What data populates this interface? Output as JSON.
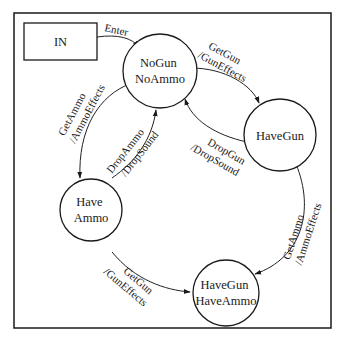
{
  "diagram": {
    "type": "state-diagram",
    "initial": {
      "id": "IN",
      "label": "IN"
    },
    "states": [
      {
        "id": "nogun_noammo",
        "lines": [
          "NoGun",
          "NoAmmo"
        ]
      },
      {
        "id": "havegun",
        "lines": [
          "HaveGun"
        ]
      },
      {
        "id": "haveammo",
        "lines": [
          "Have",
          "Ammo"
        ]
      },
      {
        "id": "havegun_haveammo",
        "lines": [
          "HaveGun",
          "HaveAmmo"
        ]
      }
    ],
    "transitions": [
      {
        "from": "IN",
        "to": "nogun_noammo",
        "lines": [
          "Enter"
        ]
      },
      {
        "from": "nogun_noammo",
        "to": "havegun",
        "lines": [
          "GetGun",
          "/GunEffects"
        ]
      },
      {
        "from": "havegun",
        "to": "nogun_noammo",
        "lines": [
          "DropGun",
          "/DropSound"
        ]
      },
      {
        "from": "nogun_noammo",
        "to": "haveammo",
        "lines": [
          "GetAmmo",
          "/AmmoEffects"
        ]
      },
      {
        "from": "haveammo",
        "to": "nogun_noammo",
        "lines": [
          "DropAmmo",
          "/DropSound"
        ]
      },
      {
        "from": "havegun",
        "to": "havegun_haveammo",
        "lines": [
          "GetAmmo",
          "/AmmoEffects"
        ]
      },
      {
        "from": "haveammo",
        "to": "havegun_haveammo",
        "lines": [
          "GetGun",
          "/GunEffects"
        ]
      }
    ]
  }
}
